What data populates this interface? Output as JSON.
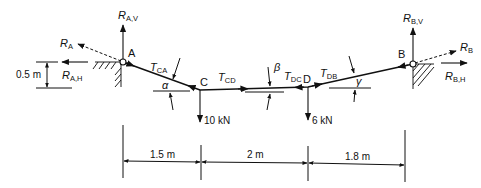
{
  "diagram": {
    "type": "cable-statics free body diagram",
    "colors": {
      "line": "#111111",
      "hatch": "#222222",
      "background": "#ffffff"
    },
    "supports": {
      "A": {
        "label": "A",
        "reaction": "R",
        "reaction_sub": "A",
        "horizontal": "R",
        "horizontal_sub": "A,H",
        "vertical": "R",
        "vertical_sub": "A,V"
      },
      "B": {
        "label": "B",
        "reaction": "R",
        "reaction_sub": "B",
        "horizontal": "R",
        "horizontal_sub": "B,H",
        "vertical": "R",
        "vertical_sub": "B,V"
      }
    },
    "points": {
      "C": {
        "label": "C",
        "load": "10 kN"
      },
      "D": {
        "label": "D",
        "load": "6 kN"
      }
    },
    "tensions": {
      "CA": {
        "symbol": "T",
        "sub": "CA"
      },
      "CD": {
        "symbol": "T",
        "sub": "CD"
      },
      "DC": {
        "symbol": "T",
        "sub": "DC"
      },
      "DB": {
        "symbol": "T",
        "sub": "DB"
      }
    },
    "angles": {
      "alpha": "α",
      "beta": "β",
      "gamma": "γ"
    },
    "dimensions": {
      "height": "0.5 m",
      "spans": [
        "1.5 m",
        "2 m",
        "1.8 m"
      ]
    }
  }
}
